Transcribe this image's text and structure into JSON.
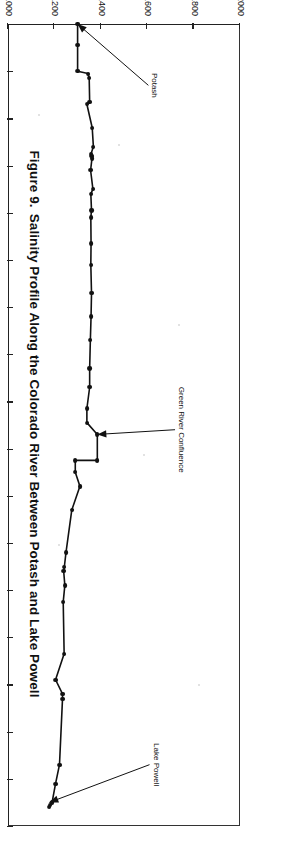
{
  "figure": {
    "number_label": "Figure 9.",
    "caption": "Salinity Profile Along the Colorado River Between Potash and Lake Powell"
  },
  "axes": {
    "x": {
      "label": "RIVER MILES",
      "min": 0,
      "max": 34,
      "ticks": [
        0,
        2,
        4,
        6,
        8,
        10,
        12,
        14,
        16,
        18,
        20,
        22,
        24,
        26,
        28,
        30,
        32,
        34
      ],
      "tick_labels": [
        "0",
        "2",
        "4",
        "6",
        "8",
        "10",
        "12",
        "14",
        "16",
        "18",
        "20",
        "22",
        "24",
        "26",
        "28",
        "30",
        "32",
        "34"
      ]
    },
    "y": {
      "label": "",
      "min": 1000,
      "max": 2000,
      "ticks": [
        1000,
        1200,
        1400,
        1600,
        1800,
        2000
      ],
      "tick_labels": [
        "1000",
        "1200",
        "1400",
        "1600",
        "1800",
        "2000"
      ]
    }
  },
  "annotations": [
    {
      "name": "potash",
      "text": "Potash",
      "point_x": 0.0,
      "point_y": 1300,
      "label_x": 2.6,
      "label_y": 1605
    },
    {
      "name": "green-river-confluence",
      "text": "Green River Confluence",
      "point_x": 17.4,
      "point_y": 1385,
      "label_x": 17.2,
      "label_y": 1720
    },
    {
      "name": "lake-powell",
      "text": "Lake Powell",
      "point_x": 33.0,
      "point_y": 1178,
      "label_x": 31.4,
      "label_y": 1610
    }
  ],
  "colors": {
    "line": "#111111",
    "marker": "#111111",
    "axis": "#222222",
    "background": "#ffffff"
  },
  "chart_data": {
    "type": "line",
    "title": "Salinity Profile Along the Colorado River Between Potash and Lake Powell",
    "xlabel": "RIVER MILES",
    "ylabel": "",
    "xlim": [
      0,
      34
    ],
    "ylim": [
      1000,
      2000
    ],
    "grid": false,
    "legend": null,
    "marker": "filled-circle",
    "series": [
      {
        "name": "Salinity (mg/L)",
        "x": [
          0.0,
          0.0,
          0.9,
          2.0,
          2.1,
          2.3,
          3.3,
          3.4,
          4.4,
          5.2,
          5.5,
          5.6,
          5.7,
          6.2,
          7.0,
          7.2,
          7.9,
          8.2,
          9.3,
          10.2,
          11.4,
          12.4,
          13.4,
          14.6,
          15.4,
          16.3,
          16.9,
          17.4,
          17.4,
          18.5,
          18.5,
          19.0,
          19.6,
          20.6,
          22.4,
          23.0,
          23.2,
          23.8,
          24.5,
          26.7,
          27.8,
          28.4,
          28.6,
          31.4,
          32.2,
          33.0,
          33.1,
          33.2
        ],
        "y": [
          1300,
          1300,
          1300,
          1300,
          1345,
          1350,
          1352,
          1340,
          1363,
          1368,
          1358,
          1360,
          1362,
          1356,
          1366,
          1357,
          1360,
          1357,
          1358,
          1357,
          1360,
          1358,
          1355,
          1352,
          1352,
          1340,
          1340,
          1385,
          1385,
          1385,
          1290,
          1290,
          1310,
          1275,
          1250,
          1243,
          1240,
          1245,
          1238,
          1242,
          1205,
          1235,
          1235,
          1222,
          1205,
          1190,
          1180,
          1178
        ]
      }
    ],
    "data_points": [
      {
        "x": 0.0,
        "y": 1300
      },
      {
        "x": 0.9,
        "y": 1300
      },
      {
        "x": 2.0,
        "y": 1300
      },
      {
        "x": 2.1,
        "y": 1345
      },
      {
        "x": 2.3,
        "y": 1350
      },
      {
        "x": 3.3,
        "y": 1352
      },
      {
        "x": 3.4,
        "y": 1340
      },
      {
        "x": 4.4,
        "y": 1363
      },
      {
        "x": 5.2,
        "y": 1368
      },
      {
        "x": 5.5,
        "y": 1358
      },
      {
        "x": 5.6,
        "y": 1360
      },
      {
        "x": 5.7,
        "y": 1362
      },
      {
        "x": 6.2,
        "y": 1356
      },
      {
        "x": 7.0,
        "y": 1366
      },
      {
        "x": 7.2,
        "y": 1357
      },
      {
        "x": 7.9,
        "y": 1360
      },
      {
        "x": 8.2,
        "y": 1357
      },
      {
        "x": 9.3,
        "y": 1358
      },
      {
        "x": 10.2,
        "y": 1357
      },
      {
        "x": 11.4,
        "y": 1360
      },
      {
        "x": 12.4,
        "y": 1358
      },
      {
        "x": 13.4,
        "y": 1355
      },
      {
        "x": 14.6,
        "y": 1352
      },
      {
        "x": 15.4,
        "y": 1352
      },
      {
        "x": 16.3,
        "y": 1340
      },
      {
        "x": 16.9,
        "y": 1340
      },
      {
        "x": 17.4,
        "y": 1385
      },
      {
        "x": 18.5,
        "y": 1385
      },
      {
        "x": 18.5,
        "y": 1290
      },
      {
        "x": 19.0,
        "y": 1290
      },
      {
        "x": 19.6,
        "y": 1310
      },
      {
        "x": 20.6,
        "y": 1275
      },
      {
        "x": 22.4,
        "y": 1250
      },
      {
        "x": 23.0,
        "y": 1243
      },
      {
        "x": 23.2,
        "y": 1240
      },
      {
        "x": 23.8,
        "y": 1245
      },
      {
        "x": 24.5,
        "y": 1238
      },
      {
        "x": 26.7,
        "y": 1242
      },
      {
        "x": 27.8,
        "y": 1205
      },
      {
        "x": 28.4,
        "y": 1235
      },
      {
        "x": 28.6,
        "y": 1235
      },
      {
        "x": 31.4,
        "y": 1222
      },
      {
        "x": 32.2,
        "y": 1205
      },
      {
        "x": 33.0,
        "y": 1190
      },
      {
        "x": 33.1,
        "y": 1180
      },
      {
        "x": 33.2,
        "y": 1178
      }
    ]
  }
}
